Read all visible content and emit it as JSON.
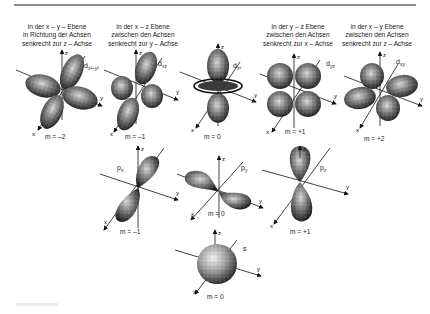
{
  "figure": {
    "type": "atomic-orbitals-diagram",
    "language": "de"
  },
  "d_orbitals": [
    {
      "id": "dx2-y2",
      "caption": [
        "in der x – y – Ebene",
        "in Richtung der Achsen",
        "senkrecht zur z – Achse"
      ],
      "label_main": "d",
      "label_sub": "x²–y²",
      "m": "m = –2",
      "axes": [
        "z",
        "y",
        "x"
      ]
    },
    {
      "id": "dxz",
      "caption": [
        "in der  x – z  Ebene",
        "zwischen den Achsen",
        "senkrecht zur  y – Achse"
      ],
      "label_main": "d",
      "label_sub": "xz",
      "m": "m = –1",
      "axes": [
        "z",
        "y",
        "x"
      ]
    },
    {
      "id": "dz2",
      "caption": [],
      "label_main": "d",
      "label_sub": "z²",
      "m": "m = 0",
      "axes": [
        "z",
        "y",
        "x"
      ]
    },
    {
      "id": "dyz",
      "caption": [
        "in der y – z Ebene",
        "zwischen den Achsen",
        "senkrecht zur x – Achse"
      ],
      "label_main": "d",
      "label_sub": "yz",
      "m": "m = +1",
      "axes": [
        "z",
        "y",
        "x"
      ]
    },
    {
      "id": "dxy",
      "caption": [
        "in der x – y Ebene",
        "zwischen den Achsen",
        "senkrecht zur z – Achse"
      ],
      "label_main": "d",
      "label_sub": "xy",
      "m": "m = +2",
      "axes": [
        "z",
        "y",
        "x"
      ]
    }
  ],
  "p_orbitals": [
    {
      "id": "px",
      "label_main": "p",
      "label_sub": "x",
      "m": "m = –1",
      "axes": [
        "z",
        "y",
        "x"
      ]
    },
    {
      "id": "py",
      "label_main": "p",
      "label_sub": "y",
      "m": "m = 0",
      "axes": [
        "z",
        "y",
        "x"
      ]
    },
    {
      "id": "pz",
      "label_main": "p",
      "label_sub": "z",
      "m": "m = +1",
      "axes": [
        "z",
        "y",
        "x"
      ]
    }
  ],
  "s_orbital": {
    "id": "s",
    "label": "s",
    "m": "m = 0",
    "axes": [
      "z",
      "y",
      "x"
    ]
  },
  "colors": {
    "lobe_dark": "#1a1a1a",
    "lobe_mid": "#555555",
    "lobe_light": "#bdbdbd",
    "rule": "#8c8c8c"
  }
}
